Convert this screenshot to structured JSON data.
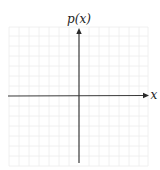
{
  "diagram": {
    "type": "coordinate-axes",
    "y_axis_label": "p(x)",
    "x_axis_label": "x",
    "grid": true,
    "grid_spacing_px": 10,
    "colors": {
      "axis": "#3a3a3a",
      "grid": "#ececec",
      "background": "#ffffff"
    }
  }
}
